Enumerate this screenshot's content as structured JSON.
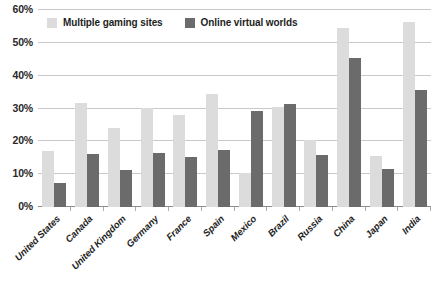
{
  "chart_data": {
    "type": "bar",
    "title": "",
    "subtitle": "",
    "xlabel": "",
    "ylabel": "",
    "ylim": [
      0,
      60
    ],
    "yticks": [
      0,
      10,
      20,
      30,
      40,
      50,
      60
    ],
    "ytick_labels": [
      "0%",
      "10%",
      "20%",
      "30%",
      "40%",
      "50%",
      "60%"
    ],
    "grid": true,
    "legend_position": "top-left",
    "categories": [
      "United States",
      "Canada",
      "United Kingdom",
      "Germany",
      "France",
      "Spain",
      "Mexico",
      "Brazil",
      "Russia",
      "China",
      "Japan",
      "India"
    ],
    "series": [
      {
        "name": "Multiple gaming sites",
        "color": "#dcdcdc",
        "values": [
          17.0,
          31.8,
          24.0,
          30.3,
          28.0,
          34.3,
          10.5,
          30.5,
          20.3,
          54.5,
          15.4,
          56.5
        ]
      },
      {
        "name": "Online virtual worlds",
        "color": "#6b6b6b",
        "values": [
          7.3,
          16.1,
          11.2,
          16.5,
          15.3,
          17.5,
          29.3,
          31.5,
          15.7,
          45.5,
          11.5,
          35.5
        ]
      }
    ]
  },
  "legend": {
    "items": [
      {
        "label": "Multiple gaming sites",
        "color": "#dcdcdc"
      },
      {
        "label": "Online virtual worlds",
        "color": "#6b6b6b"
      }
    ]
  },
  "caption": {
    "text": ""
  },
  "colors": {
    "series_light": "#dcdcdc",
    "series_dark": "#6b6b6b",
    "gridline": "#c9c9c9",
    "axis": "#8d8d8d",
    "text": "#1e1e1e",
    "background": "#ffffff"
  }
}
